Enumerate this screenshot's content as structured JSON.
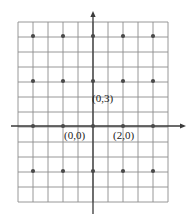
{
  "figure": {
    "title": "",
    "background": "#ffffff",
    "grid_color": "#8c8c8c",
    "axis_color": "#3a3a3a",
    "point_color": "#4a4a4a",
    "label_color": "#1a1a1a"
  },
  "axes": {
    "x_axis": {
      "name": "x-axis",
      "y_pixel": 126,
      "x_start": 11,
      "x_end": 186,
      "arrow": "right"
    },
    "y_axis": {
      "name": "y-axis",
      "x_pixel": 93,
      "y_start": 11,
      "y_end": 214,
      "arrow": "up"
    }
  },
  "grid": {
    "left": 18,
    "right": 168,
    "top": 22,
    "bottom": 202,
    "cell_width": 15,
    "cell_height": 15,
    "x_lines": [
      18,
      33,
      48,
      63,
      78,
      93,
      108,
      123,
      138,
      153,
      168
    ],
    "y_lines": [
      22,
      37,
      52,
      67,
      82,
      97,
      112,
      127,
      142,
      157,
      172,
      187,
      202
    ]
  },
  "lattice_points": {
    "name": "sublattice-points",
    "x_spacing": 30,
    "y_spacing": 45,
    "radius": 2.1,
    "xs": [
      33,
      63,
      93,
      123,
      153
    ],
    "ys": [
      36,
      81,
      126,
      171
    ]
  },
  "labels": [
    {
      "id": "origin",
      "text": "(0,0)",
      "x": 64,
      "y": 139
    },
    {
      "id": "e1",
      "text": "(2,0)",
      "x": 113,
      "y": 139
    },
    {
      "id": "e2",
      "text": "(0,3)",
      "x": 92,
      "y": 102
    }
  ],
  "chart_data": {
    "type": "scatter",
    "title": "",
    "xlabel": "",
    "ylabel": "",
    "grid": true,
    "legend": "none",
    "annotations": [
      "(0,0)",
      "(2,0)",
      "(0,3)"
    ],
    "basis_vectors": [
      [
        2,
        0
      ],
      [
        0,
        3
      ]
    ],
    "points_lattice_coords": [
      [
        -4,
        6
      ],
      [
        -2,
        6
      ],
      [
        0,
        6
      ],
      [
        2,
        6
      ],
      [
        4,
        6
      ],
      [
        -4,
        3
      ],
      [
        -2,
        3
      ],
      [
        0,
        3
      ],
      [
        2,
        3
      ],
      [
        4,
        3
      ],
      [
        -4,
        0
      ],
      [
        -2,
        0
      ],
      [
        0,
        0
      ],
      [
        2,
        0
      ],
      [
        4,
        0
      ],
      [
        -4,
        -3
      ],
      [
        -2,
        -3
      ],
      [
        0,
        -3
      ],
      [
        2,
        -3
      ],
      [
        4,
        -3
      ]
    ],
    "xlim": [
      -5,
      5
    ],
    "ylim": [
      -7,
      7
    ]
  }
}
